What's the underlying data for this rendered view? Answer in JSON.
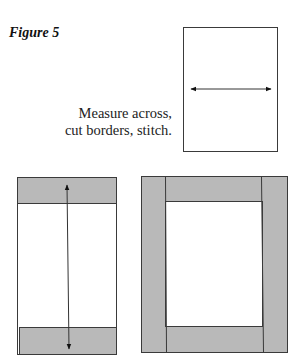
{
  "figure": {
    "title": "Figure 5",
    "caption_line1": "Measure across,",
    "caption_line2": "cut borders, stitch."
  },
  "colors": {
    "border_fill": "#b9b9b9",
    "outline": "#3a3a3a",
    "background": "#ffffff"
  },
  "panels": [
    {
      "name": "quilt-top-measure-across",
      "arrow": "horizontal"
    },
    {
      "name": "quilt-top-with-top-bottom-borders",
      "arrow": "vertical"
    },
    {
      "name": "quilt-top-with-all-borders",
      "arrow": "none"
    }
  ]
}
